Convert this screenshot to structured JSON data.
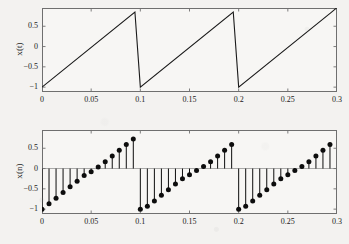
{
  "figure": {
    "background_color": "#f3f2f0",
    "axes_color": "#6f6f6f",
    "line_color": "#1a1a1a",
    "marker_color": "#0d0d0d",
    "panel_background": "#f7f6f4"
  },
  "chart_data": [
    {
      "type": "line",
      "id": "continuous-sawtooth",
      "title": "",
      "xlabel": "",
      "ylabel": "x(t)",
      "xlim": [
        0,
        0.3
      ],
      "ylim": [
        -1.12,
        0.95
      ],
      "grid": false,
      "legend": null,
      "xticks": [
        0,
        0.05,
        0.1,
        0.15,
        0.2,
        0.25,
        0.3
      ],
      "xticklabels": [
        "0",
        "0.05",
        "0.1",
        "0.15",
        "0.2",
        "0.25",
        "0.3"
      ],
      "yticks": [
        0.5,
        0,
        -0.5,
        -1
      ],
      "yticklabels": [
        "0.5",
        "0",
        "−0.5",
        "−1"
      ],
      "description": "Continuous-time sawtooth wave, period 0.1 s, amplitude from -1 to 0.85, three rising ramps with vertical drops at t = 0.1 and t = 0.2",
      "period": 0.1,
      "amplitude_min": -1,
      "amplitude_max": 0.85,
      "x": [
        0,
        0.0945,
        0.1,
        0.1945,
        0.2,
        0.2945,
        0.3
      ],
      "y": [
        -1,
        0.85,
        -1,
        0.85,
        -1,
        0.85,
        0.96
      ]
    },
    {
      "type": "stem",
      "id": "discrete-sawtooth",
      "title": "",
      "xlabel": "",
      "ylabel": "x(n)",
      "xlim": [
        0,
        0.3
      ],
      "ylim": [
        -1.12,
        0.95
      ],
      "grid": false,
      "legend": null,
      "xticks": [
        0,
        0.05,
        0.1,
        0.15,
        0.2,
        0.25,
        0.3
      ],
      "xticklabels": [
        "0",
        "0.05",
        "0.1",
        "0.15",
        "0.2",
        "0.25",
        "0.3"
      ],
      "yticks": [
        0.5,
        0,
        -0.5,
        -1
      ],
      "yticklabels": [
        "0.5",
        "0",
        "−0.5",
        "−1"
      ],
      "description": "Discrete-time sampled sawtooth, stem plot with filled circular markers, baseline at zero, 14 samples per 0.1 s period",
      "baseline": 0,
      "samples_per_period": 14,
      "sample_interval": 0.00714,
      "x": [
        0.0,
        0.00714,
        0.01429,
        0.02143,
        0.02857,
        0.03571,
        0.04286,
        0.05,
        0.05714,
        0.06429,
        0.07143,
        0.07857,
        0.08571,
        0.09286,
        0.1,
        0.10714,
        0.11429,
        0.12143,
        0.12857,
        0.13571,
        0.14286,
        0.15,
        0.15714,
        0.16429,
        0.17143,
        0.17857,
        0.18571,
        0.19286,
        0.2,
        0.20714,
        0.21429,
        0.22143,
        0.22857,
        0.23571,
        0.24286,
        0.25,
        0.25714,
        0.26429,
        0.27143,
        0.27857,
        0.28571,
        0.29286
      ],
      "y": [
        -1.0,
        -0.87,
        -0.73,
        -0.59,
        -0.45,
        -0.31,
        -0.17,
        -0.03,
        0.05,
        0.17,
        0.31,
        0.45,
        0.59,
        0.73,
        0.85,
        -1.0,
        -0.87,
        -0.73,
        -0.59,
        -0.45,
        -0.31,
        -0.17,
        -0.03,
        0.05,
        0.17,
        0.31,
        0.45,
        0.59,
        0.73,
        -1.0,
        -0.87,
        -0.73,
        -0.59,
        -0.45,
        -0.31,
        -0.17,
        -0.03,
        0.05,
        0.17,
        0.31,
        0.45,
        0.59
      ],
      "y_fixed": [
        -1.0,
        -0.87,
        -0.73,
        -0.59,
        -0.45,
        -0.31,
        -0.17,
        -0.08,
        0.04,
        0.17,
        0.31,
        0.45,
        0.59,
        0.73,
        -1.0,
        -0.93,
        -0.8,
        -0.66,
        -0.52,
        -0.38,
        -0.25,
        -0.15,
        -0.05,
        0.05,
        0.17,
        0.31,
        0.45,
        0.59,
        -1.0,
        -0.93,
        -0.8,
        -0.66,
        -0.52,
        -0.38,
        -0.25,
        -0.15,
        -0.05,
        0.05,
        0.17,
        0.31,
        0.45,
        0.59
      ]
    }
  ]
}
